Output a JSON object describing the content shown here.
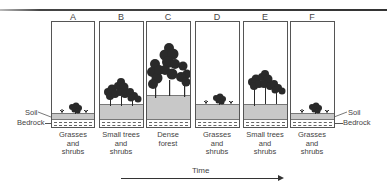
{
  "diagram": {
    "type": "ecological-succession",
    "panels": [
      {
        "letter": "A",
        "caption": [
          "Grasses",
          "and",
          "shrubs"
        ],
        "vegetation": "grasses-and-shrubs",
        "soil_depth": "thin"
      },
      {
        "letter": "B",
        "caption": [
          "Small trees",
          "and",
          "shrubs"
        ],
        "vegetation": "small-trees",
        "soil_depth": "medium"
      },
      {
        "letter": "C",
        "caption": [
          "Dense",
          "forest"
        ],
        "vegetation": "dense-forest",
        "soil_depth": "thick"
      },
      {
        "letter": "D",
        "caption": [
          "Grasses",
          "and",
          "shrubs"
        ],
        "vegetation": "grasses-and-shrubs",
        "soil_depth": "medium"
      },
      {
        "letter": "E",
        "caption": [
          "Small trees",
          "and",
          "shrubs"
        ],
        "vegetation": "small-trees",
        "soil_depth": "medium"
      },
      {
        "letter": "F",
        "caption": [
          "Grasses",
          "and",
          "shrubs"
        ],
        "vegetation": "grasses-and-shrubs",
        "soil_depth": "thin"
      }
    ],
    "left_labels": {
      "soil": "Soil",
      "bedrock": "Bedrock"
    },
    "right_labels": {
      "soil": "Soil",
      "bedrock": "Bedrock"
    },
    "axis": {
      "label": "Time",
      "direction": "right"
    },
    "colors": {
      "soil": "#c8c8c8",
      "lines": "#555555",
      "trees": "#2a2a2a"
    }
  }
}
